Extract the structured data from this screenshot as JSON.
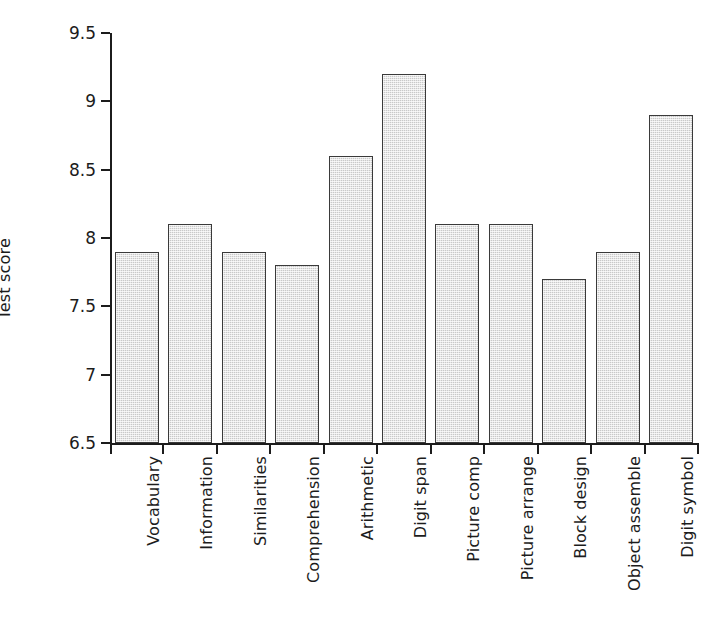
{
  "chart_data": {
    "type": "bar",
    "title": "",
    "xlabel": "",
    "ylabel": "Test score",
    "ylim": [
      6.5,
      9.5
    ],
    "ytick_labels": [
      "6.5",
      "7",
      "7.5",
      "8",
      "8.5",
      "9",
      "9.5"
    ],
    "ytick_values": [
      6.5,
      7,
      7.5,
      8,
      8.5,
      9,
      9.5
    ],
    "grid": false,
    "legend": null,
    "bar_color": "#c9c9c9",
    "bar_edge_color": "#3a3a3a",
    "axis_color": "#1c1c1c",
    "categories": [
      "Vocabulary",
      "Information",
      "Similarities",
      "Comprehension",
      "Arithmetic",
      "Digit span",
      "Picture comp",
      "Picture arrange",
      "Block design",
      "Object assemble",
      "Digit symbol"
    ],
    "values": [
      7.9,
      8.1,
      7.9,
      7.8,
      8.6,
      9.2,
      8.1,
      8.1,
      7.7,
      7.9,
      8.9
    ]
  }
}
